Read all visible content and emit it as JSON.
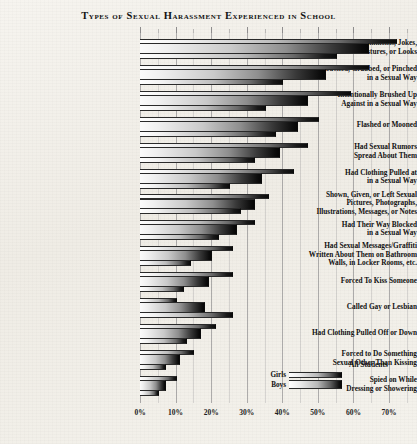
{
  "chart_data": {
    "type": "bar",
    "title": "Types of Sexual Harassment Experienced in School",
    "orientation": "horizontal",
    "xlabel": "",
    "ylabel": "",
    "xlim": [
      0,
      75
    ],
    "xticks": [
      "0%",
      "10%",
      "20%",
      "30%",
      "40%",
      "50%",
      "60%",
      "70%"
    ],
    "xtick_values": [
      0,
      10,
      20,
      30,
      40,
      50,
      60,
      70
    ],
    "minor_tick_step": 5,
    "grid": true,
    "grid_axis": "x",
    "legend_position": "bottom-right",
    "legend": [
      "All Students",
      "Girls",
      "Boys"
    ],
    "categories": [
      "Sexual Comments, Jokes, Gestures, or Looks",
      "Touched, Grabbed, or Pinched in a Sexual Way",
      "Intentionally Brushed Up Against in a Sexual Way",
      "Flashed or Mooned",
      "Had Sexual Rumors Spread About Them",
      "Had Clothing Pulled at in a Sexual Way",
      "Shown, Given, or Left Sexual Pictures, Photographs, Illustrations, Messages, or Notes",
      "Had Their Way Blocked in a Sexual Way",
      "Had Sexual Messages/Graffiti Written About Them on Bathroom Walls, in Locker Rooms, etc.",
      "Forced To Kiss Someone",
      "Called Gay or Lesbian",
      "Had Clothing Pulled Off or Down",
      "Forced to Do Something Sexual Other Than Kissing",
      "Spied on While Dressing or Showering"
    ],
    "category_lines": [
      [
        "Sexual Comments, Jokes,",
        "Gestures, or Looks"
      ],
      [
        "Touched, Grabbed, or Pinched",
        "in a Sexual Way"
      ],
      [
        "Intentionally Brushed Up",
        "Against in a Sexual Way"
      ],
      [
        "Flashed or Mooned"
      ],
      [
        "Had Sexual Rumors",
        "Spread About Them"
      ],
      [
        "Had Clothing Pulled at",
        "in a Sexual Way"
      ],
      [
        "Shown, Given, or Left Sexual",
        "Pictures, Photographs,",
        "Illustrations, Messages, or Notes"
      ],
      [
        "Had Their Way Blocked",
        "in a Sexual Way"
      ],
      [
        "Had Sexual Messages/Graffiti",
        "Written About Them on Bathroom",
        "Walls, in Locker Rooms, etc."
      ],
      [
        "Forced To Kiss Someone"
      ],
      [
        "Called Gay or Lesbian"
      ],
      [
        "Had Clothing Pulled Off or Down"
      ],
      [
        "Forced to Do Something",
        "Sexual Other Than Kissing"
      ],
      [
        "Spied on While",
        "Dressing or Showering"
      ]
    ],
    "series": [
      {
        "name": "Girls",
        "values": [
          72,
          64,
          59,
          50,
          47,
          43,
          36,
          32,
          26,
          26,
          10,
          21,
          15,
          10
        ]
      },
      {
        "name": "All Students",
        "values": [
          64,
          52,
          47,
          44,
          39,
          34,
          32,
          27,
          20,
          19,
          18,
          17,
          11,
          7
        ]
      },
      {
        "name": "Boys",
        "values": [
          55,
          40,
          35,
          38,
          32,
          25,
          28,
          22,
          14,
          12,
          26,
          13,
          7,
          5
        ]
      }
    ]
  },
  "legend_labels": {
    "all_students": "All Students",
    "girls": "Girls",
    "boys": "Boys"
  }
}
